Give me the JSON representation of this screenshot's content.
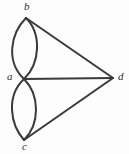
{
  "figure": {
    "kind": "undirected-multigraph-diagram",
    "background_color": "#fdfdfd",
    "stroke_color": "#3a3a3a",
    "stroke_width": 2,
    "label_color": "#2e2e2e",
    "width": 129,
    "height": 154
  },
  "vertices": [
    {
      "id": "b",
      "label": "b",
      "x": 26,
      "y": 18
    },
    {
      "id": "a",
      "label": "a",
      "x": 24,
      "y": 79
    },
    {
      "id": "c",
      "label": "c",
      "x": 24,
      "y": 140
    },
    {
      "id": "d",
      "label": "d",
      "x": 113,
      "y": 78
    }
  ],
  "edges": [
    {
      "id": "ab-left",
      "from": "a",
      "to": "b",
      "style": "curved",
      "bulge": "left",
      "multiplicity_index": 1
    },
    {
      "id": "ab-right",
      "from": "a",
      "to": "b",
      "style": "curved",
      "bulge": "right",
      "multiplicity_index": 2
    },
    {
      "id": "ac-left",
      "from": "a",
      "to": "c",
      "style": "curved",
      "bulge": "left",
      "multiplicity_index": 1
    },
    {
      "id": "ac-right",
      "from": "a",
      "to": "c",
      "style": "curved",
      "bulge": "right",
      "multiplicity_index": 2
    },
    {
      "id": "ad",
      "from": "a",
      "to": "d",
      "style": "straight"
    },
    {
      "id": "bd",
      "from": "b",
      "to": "d",
      "style": "straight"
    },
    {
      "id": "cd",
      "from": "c",
      "to": "d",
      "style": "straight"
    }
  ],
  "paths": {
    "ab_left": "M 26,18 C 10,34 6,62 24,79",
    "ab_right": "M 26,18 C 42,34 40,64 24,79",
    "ac_left": "M 24,79 C 6,96 10,124 24,140",
    "ac_right": "M 24,79 C 40,95 40,124 24,140",
    "ad": "M 24,79 L 113,78",
    "bd": "M 26,18 L 113,78",
    "cd": "M 24,140 L 113,78"
  }
}
